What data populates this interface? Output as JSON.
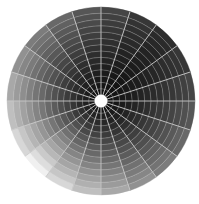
{
  "chart_data": {
    "type": "heatmap",
    "subtype": "polar-grid",
    "title": "",
    "xlabel": "",
    "ylabel": "",
    "center": [
      101,
      101
    ],
    "inner_radius": 6,
    "outer_radius": 94,
    "sectors": 20,
    "sector_angle_deg": 18,
    "rings": 14,
    "grid_line_color": "#c8c8c8",
    "hole_color": "#ffffff",
    "background_color": "#ffffff",
    "shading": {
      "description": "Grayscale lightness increases outward with radius and varies with angle; brightest toward bottom-left (~225°), darkest toward top-right (~45°)",
      "brightest_angle_deg": 225,
      "darkest_angle_deg": 45,
      "outer_brightest_gray": 240,
      "outer_darkest_gray": 45,
      "inner_gray": 15
    },
    "legend": []
  }
}
